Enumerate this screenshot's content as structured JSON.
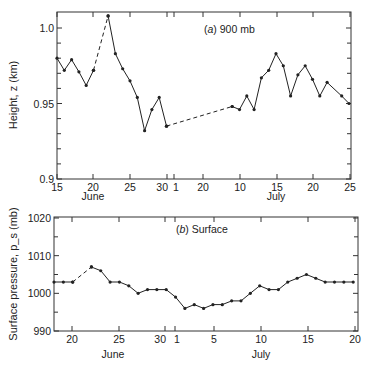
{
  "chart_data": [
    {
      "type": "line",
      "title": "(a) 900 mb",
      "panel_letter": "a",
      "panel_text": "900 mb",
      "xlabel": "",
      "ylabel": "Height, z (km)",
      "ylim": [
        0.9,
        1.01
      ],
      "yticks": [
        0.9,
        0.95,
        1.0
      ],
      "ytick_labels": [
        "0.9",
        "0.95",
        "1.0"
      ],
      "xtick_labels": [
        "15",
        "20",
        "25",
        "30",
        "1",
        "20",
        "10",
        "15",
        "20",
        "25"
      ],
      "month_labels": [
        "June",
        "July"
      ],
      "grid": false,
      "series": [
        {
          "name": "900 mb height",
          "segments": [
            {
              "style": "solid",
              "x": [
                "Jun 15",
                "Jun 16",
                "Jun 17",
                "Jun 18",
                "Jun 19",
                "Jun 20"
              ],
              "y": [
                0.98,
                0.972,
                0.979,
                0.971,
                0.962,
                0.972
              ]
            },
            {
              "style": "dashed",
              "x": [
                "Jun 20",
                "Jun 22"
              ],
              "y": [
                0.972,
                1.008
              ]
            },
            {
              "style": "solid",
              "x": [
                "Jun 22",
                "Jun 23",
                "Jun 24",
                "Jun 25",
                "Jun 26",
                "Jun 27",
                "Jun 28",
                "Jun 29",
                "Jun 30"
              ],
              "y": [
                1.008,
                0.983,
                0.973,
                0.965,
                0.954,
                0.932,
                0.946,
                0.954,
                0.935
              ]
            },
            {
              "style": "dashed",
              "x": [
                "Jun 30",
                "Jul 9"
              ],
              "y": [
                0.935,
                0.948
              ]
            },
            {
              "style": "solid",
              "x": [
                "Jul 9",
                "Jul 10",
                "Jul 11",
                "Jul 12",
                "Jul 13",
                "Jul 14",
                "Jul 15",
                "Jul 16",
                "Jul 17",
                "Jul 18",
                "Jul 19",
                "Jul 20",
                "Jul 21",
                "Jul 22",
                "Jul 24",
                "Jul 25"
              ],
              "y": [
                0.948,
                0.946,
                0.955,
                0.946,
                0.967,
                0.972,
                0.983,
                0.975,
                0.955,
                0.969,
                0.975,
                0.966,
                0.955,
                0.964,
                0.955,
                0.95
              ]
            }
          ]
        }
      ]
    },
    {
      "type": "line",
      "title": "(b) Surface",
      "panel_letter": "b",
      "panel_text": "Surface",
      "xlabel": "",
      "ylabel": "Surface pressure, p_s (mb)",
      "ylim": [
        990,
        1020
      ],
      "yticks": [
        990,
        1000,
        1010,
        1020
      ],
      "ytick_labels": [
        "990",
        "1000",
        "1010",
        "1020"
      ],
      "xtick_labels": [
        "20",
        "25",
        "30",
        "1",
        "5",
        "10",
        "15",
        "20"
      ],
      "month_labels": [
        "June",
        "July"
      ],
      "grid": false,
      "series": [
        {
          "name": "Surface pressure",
          "segments": [
            {
              "style": "solid",
              "x": [
                "Jun 18",
                "Jun 19",
                "Jun 20"
              ],
              "y": [
                1003,
                1003,
                1003
              ]
            },
            {
              "style": "dashed",
              "x": [
                "Jun 20",
                "Jun 22"
              ],
              "y": [
                1003,
                1007
              ]
            },
            {
              "style": "solid",
              "x": [
                "Jun 22",
                "Jun 23",
                "Jun 24",
                "Jun 25",
                "Jun 26",
                "Jun 27",
                "Jun 28",
                "Jun 29",
                "Jun 30",
                "Jul 1",
                "Jul 2",
                "Jul 3",
                "Jul 4",
                "Jul 5",
                "Jul 6",
                "Jul 7",
                "Jul 8",
                "Jul 9",
                "Jul 10",
                "Jul 11",
                "Jul 12",
                "Jul 13",
                "Jul 14",
                "Jul 15",
                "Jul 16",
                "Jul 17",
                "Jul 18",
                "Jul 19",
                "Jul 20"
              ],
              "y": [
                1007,
                1006,
                1003,
                1003,
                1002,
                1000,
                1001,
                1001,
                1001,
                999,
                996,
                997,
                996,
                997,
                997,
                998,
                998,
                1000,
                1002,
                1001,
                1001,
                1003,
                1004,
                1005,
                1004,
                1003,
                1003,
                1003,
                1003
              ]
            }
          ]
        }
      ]
    }
  ]
}
